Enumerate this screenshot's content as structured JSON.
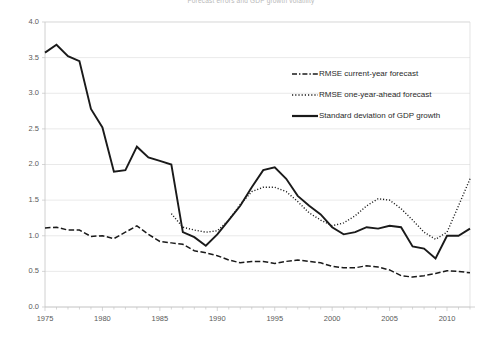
{
  "chart_data": {
    "type": "line",
    "title": "Forecast errors and GDP growth volatility",
    "xlabel": "",
    "ylabel": "",
    "xlim": [
      1975,
      2012
    ],
    "ylim": [
      0.0,
      4.0
    ],
    "grid": "horizontal",
    "legend_position": "upper-right-inside",
    "ytick_labels": [
      "0.0",
      "0.5",
      "1.0",
      "1.5",
      "2.0",
      "2.5",
      "3.0",
      "3.5",
      "4.0"
    ],
    "ytick_values": [
      0.0,
      0.5,
      1.0,
      1.5,
      2.0,
      2.5,
      3.0,
      3.5,
      4.0
    ],
    "xtick_labels": [
      "1975",
      "1980",
      "1985",
      "1990",
      "1995",
      "2000",
      "2005",
      "2010"
    ],
    "xtick_values": [
      1975,
      1980,
      1985,
      1990,
      1995,
      2000,
      2005,
      2010
    ],
    "x": [
      1975,
      1976,
      1977,
      1978,
      1979,
      1980,
      1981,
      1982,
      1983,
      1984,
      1985,
      1986,
      1987,
      1988,
      1989,
      1990,
      1991,
      1992,
      1993,
      1994,
      1995,
      1996,
      1997,
      1998,
      1999,
      2000,
      2001,
      2002,
      2003,
      2004,
      2005,
      2006,
      2007,
      2008,
      2009,
      2010,
      2011,
      2012
    ],
    "series": [
      {
        "name": "Standard deviation of GDP growth",
        "style": "solid",
        "x": [
          1975,
          1976,
          1977,
          1978,
          1979,
          1980,
          1981,
          1982,
          1983,
          1984,
          1985,
          1986,
          1987,
          1988,
          1989,
          1990,
          1991,
          1992,
          1993,
          1994,
          1995,
          1996,
          1997,
          1998,
          1999,
          2000,
          2001,
          2002,
          2003,
          2004,
          2005,
          2006,
          2007,
          2008,
          2009,
          2010,
          2011,
          2012
        ],
        "values": [
          3.57,
          3.68,
          3.52,
          3.45,
          2.78,
          2.52,
          1.9,
          1.92,
          2.25,
          2.1,
          2.05,
          2.0,
          1.05,
          0.98,
          0.86,
          1.02,
          1.22,
          1.42,
          1.68,
          1.92,
          1.96,
          1.8,
          1.56,
          1.42,
          1.3,
          1.12,
          1.02,
          1.05,
          1.12,
          1.1,
          1.14,
          1.12,
          0.85,
          0.82,
          0.68,
          1.0,
          1.0,
          1.1
        ]
      },
      {
        "name": "RMSE one-year-ahead forecast",
        "style": "dotted",
        "x": [
          1986,
          1987,
          1988,
          1989,
          1990,
          1991,
          1992,
          1993,
          1994,
          1995,
          1996,
          1997,
          1998,
          1999,
          2000,
          2001,
          2002,
          2003,
          2004,
          2005,
          2006,
          2007,
          2008,
          2009,
          2010,
          2011,
          2012
        ],
        "values": [
          1.31,
          1.12,
          1.08,
          1.05,
          1.07,
          1.22,
          1.44,
          1.62,
          1.68,
          1.68,
          1.62,
          1.48,
          1.32,
          1.22,
          1.14,
          1.18,
          1.28,
          1.42,
          1.52,
          1.5,
          1.38,
          1.22,
          1.05,
          0.95,
          1.05,
          1.42,
          1.8
        ]
      },
      {
        "name": "RMSE current-year forecast",
        "style": "dashed",
        "x": [
          1975,
          1976,
          1977,
          1978,
          1979,
          1980,
          1981,
          1982,
          1983,
          1984,
          1985,
          1986,
          1987,
          1988,
          1989,
          1990,
          1991,
          1992,
          1993,
          1994,
          1995,
          1996,
          1997,
          1998,
          1999,
          2000,
          2001,
          2002,
          2003,
          2004,
          2005,
          2006,
          2007,
          2008,
          2009,
          2010,
          2011,
          2012
        ],
        "values": [
          1.11,
          1.12,
          1.08,
          1.08,
          0.99,
          1.0,
          0.96,
          1.05,
          1.14,
          1.02,
          0.92,
          0.9,
          0.88,
          0.79,
          0.76,
          0.72,
          0.66,
          0.62,
          0.64,
          0.64,
          0.61,
          0.64,
          0.66,
          0.64,
          0.62,
          0.57,
          0.55,
          0.55,
          0.58,
          0.56,
          0.52,
          0.44,
          0.42,
          0.44,
          0.47,
          0.51,
          0.5,
          0.48
        ]
      }
    ]
  },
  "legend": {
    "items": [
      {
        "label": "RMSE current-year forecast",
        "style": "dashed"
      },
      {
        "label": "RMSE one-year-ahead forecast",
        "style": "dotted"
      },
      {
        "label": "Standard deviation of GDP growth",
        "style": "solid"
      }
    ]
  },
  "colors": {
    "ink": "#1a1a1a",
    "grid": "#e0e0e0",
    "axis": "#c4c4c4",
    "tick_text": "#5a5a5a",
    "background": "#ffffff"
  }
}
